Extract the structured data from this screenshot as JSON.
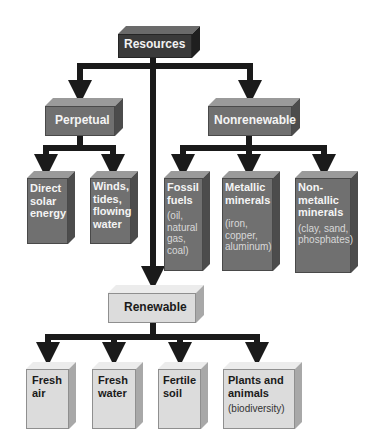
{
  "diagram": {
    "root": {
      "label": "Resources"
    },
    "perpetual": {
      "label": "Perpetual",
      "children": [
        {
          "label": "Direct solar energy"
        },
        {
          "label": "Winds, tides, flowing water"
        }
      ]
    },
    "nonrenewable": {
      "label": "Nonrenewable",
      "children": [
        {
          "label": "Fossil fuels",
          "detail": "(oil, natural gas, coal)"
        },
        {
          "label": "Metallic minerals",
          "detail": "(iron, copper, aluminum)"
        },
        {
          "label": "Non-metallic minerals",
          "detail": "(clay, sand, phosphates)"
        }
      ]
    },
    "renewable": {
      "label": "Renewable",
      "children": [
        {
          "label": "Fresh air"
        },
        {
          "label": "Fresh water"
        },
        {
          "label": "Fertile soil"
        },
        {
          "label": "Plants and animals",
          "detail": "(biodiversity)"
        }
      ]
    }
  },
  "colors": {
    "root": "#3a3a3a",
    "category_dark": "#707070",
    "renewable_light": "#dcdcdc",
    "connector": "#1a1a1a"
  }
}
